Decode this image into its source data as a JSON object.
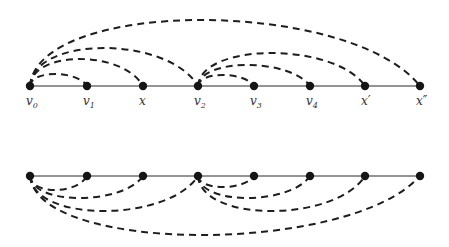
{
  "diagram": {
    "type": "path graphs with dashed arcs",
    "top": {
      "y": 86,
      "nodes": [
        {
          "id": "v0",
          "label": "v",
          "sub": "0",
          "x": 30
        },
        {
          "id": "v1",
          "label": "v",
          "sub": "1",
          "x": 87
        },
        {
          "id": "x",
          "label": "x",
          "sub": "",
          "x": 143
        },
        {
          "id": "v2",
          "label": "v",
          "sub": "2",
          "x": 198
        },
        {
          "id": "v3",
          "label": "v",
          "sub": "3",
          "x": 254
        },
        {
          "id": "v4",
          "label": "v",
          "sub": "4",
          "x": 310
        },
        {
          "id": "xp",
          "label": "x′",
          "sub": "",
          "x": 365
        },
        {
          "id": "xpp",
          "label": "x″",
          "sub": "",
          "x": 420
        }
      ],
      "arcs": [
        {
          "from": "v0",
          "to": "v1",
          "peak": 74
        },
        {
          "from": "v0",
          "to": "x",
          "peak": 59
        },
        {
          "from": "v0",
          "to": "v2",
          "peak": 48
        },
        {
          "from": "v0",
          "to": "xpp",
          "peak": 20
        },
        {
          "from": "v2",
          "to": "v3",
          "peak": 75
        },
        {
          "from": "v2",
          "to": "v4",
          "peak": 65
        },
        {
          "from": "v2",
          "to": "xp",
          "peak": 53
        }
      ]
    },
    "bottom": {
      "y": 176,
      "arcs": [
        {
          "from": 0,
          "to": 1,
          "peak": 190
        },
        {
          "from": 0,
          "to": 2,
          "peak": 198
        },
        {
          "from": 0,
          "to": 3,
          "peak": 211
        },
        {
          "from": 0,
          "to": 7,
          "peak": 235
        },
        {
          "from": 3,
          "to": 4,
          "peak": 187
        },
        {
          "from": 3,
          "to": 5,
          "peak": 198
        },
        {
          "from": 3,
          "to": 6,
          "peak": 211
        }
      ]
    }
  }
}
